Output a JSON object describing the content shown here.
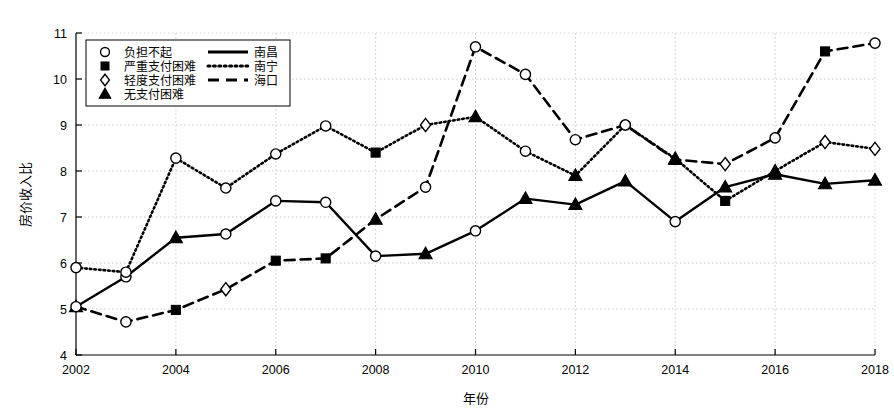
{
  "chart_data": {
    "type": "line",
    "title": "",
    "xlabel": "年份",
    "ylabel": "房价收入比",
    "xlim": [
      2002,
      2018
    ],
    "ylim": [
      4,
      11
    ],
    "yticks": [
      4,
      5,
      6,
      7,
      8,
      9,
      10,
      11
    ],
    "xticks": [
      2002,
      2004,
      2006,
      2008,
      2010,
      2012,
      2014,
      2016,
      2018
    ],
    "grid": true,
    "x": [
      2002,
      2003,
      2004,
      2005,
      2006,
      2007,
      2008,
      2009,
      2010,
      2011,
      2012,
      2013,
      2014,
      2015,
      2016,
      2017,
      2018
    ],
    "legend_position": "upper-left",
    "series": [
      {
        "name": "南昌",
        "line_style": "solid",
        "values": [
          5.05,
          5.7,
          6.55,
          6.63,
          7.35,
          7.32,
          6.15,
          6.2,
          6.7,
          7.4,
          7.27,
          7.78,
          6.9,
          7.65,
          7.93,
          7.72,
          7.8
        ],
        "markers": [
          "triangle",
          "circle",
          "triangle",
          "circle",
          "circle",
          "circle",
          "circle",
          "triangle",
          "circle",
          "triangle",
          "triangle",
          "triangle",
          "circle",
          "triangle",
          "triangle",
          "triangle",
          "triangle"
        ]
      },
      {
        "name": "南宁",
        "line_style": "dotted",
        "values": [
          5.9,
          5.8,
          8.28,
          7.63,
          8.37,
          8.98,
          8.4,
          9.0,
          9.18,
          8.43,
          7.9,
          9.0,
          8.27,
          7.35,
          8.0,
          8.63,
          8.48
        ],
        "markers": [
          "circle",
          "circle",
          "circle",
          "circle",
          "circle",
          "circle",
          "square",
          "diamond",
          "triangle",
          "circle",
          "triangle",
          "circle",
          "triangle",
          "square",
          "triangle",
          "diamond",
          "diamond"
        ]
      },
      {
        "name": "海口",
        "line_style": "dashed",
        "values": [
          5.05,
          4.72,
          4.98,
          5.43,
          6.05,
          6.1,
          6.95,
          7.65,
          10.7,
          10.1,
          8.68,
          9.0,
          8.25,
          8.15,
          8.72,
          10.6,
          10.78
        ],
        "markers": [
          "circle",
          "circle",
          "square",
          "diamond",
          "square",
          "square",
          "triangle",
          "circle",
          "circle",
          "circle",
          "circle",
          "circle",
          "triangle",
          "diamond",
          "circle",
          "square",
          "circle"
        ]
      }
    ],
    "legend_markers": [
      {
        "marker": "circle",
        "label": "负担不起"
      },
      {
        "marker": "square",
        "label": "严重支付困难"
      },
      {
        "marker": "diamond",
        "label": "轻度支付困难"
      },
      {
        "marker": "triangle",
        "label": "无支付困难"
      }
    ],
    "legend_lines": [
      {
        "line_style": "solid",
        "label": "南昌"
      },
      {
        "line_style": "dotted",
        "label": "南宁"
      },
      {
        "line_style": "dashed",
        "label": "海口"
      }
    ]
  }
}
